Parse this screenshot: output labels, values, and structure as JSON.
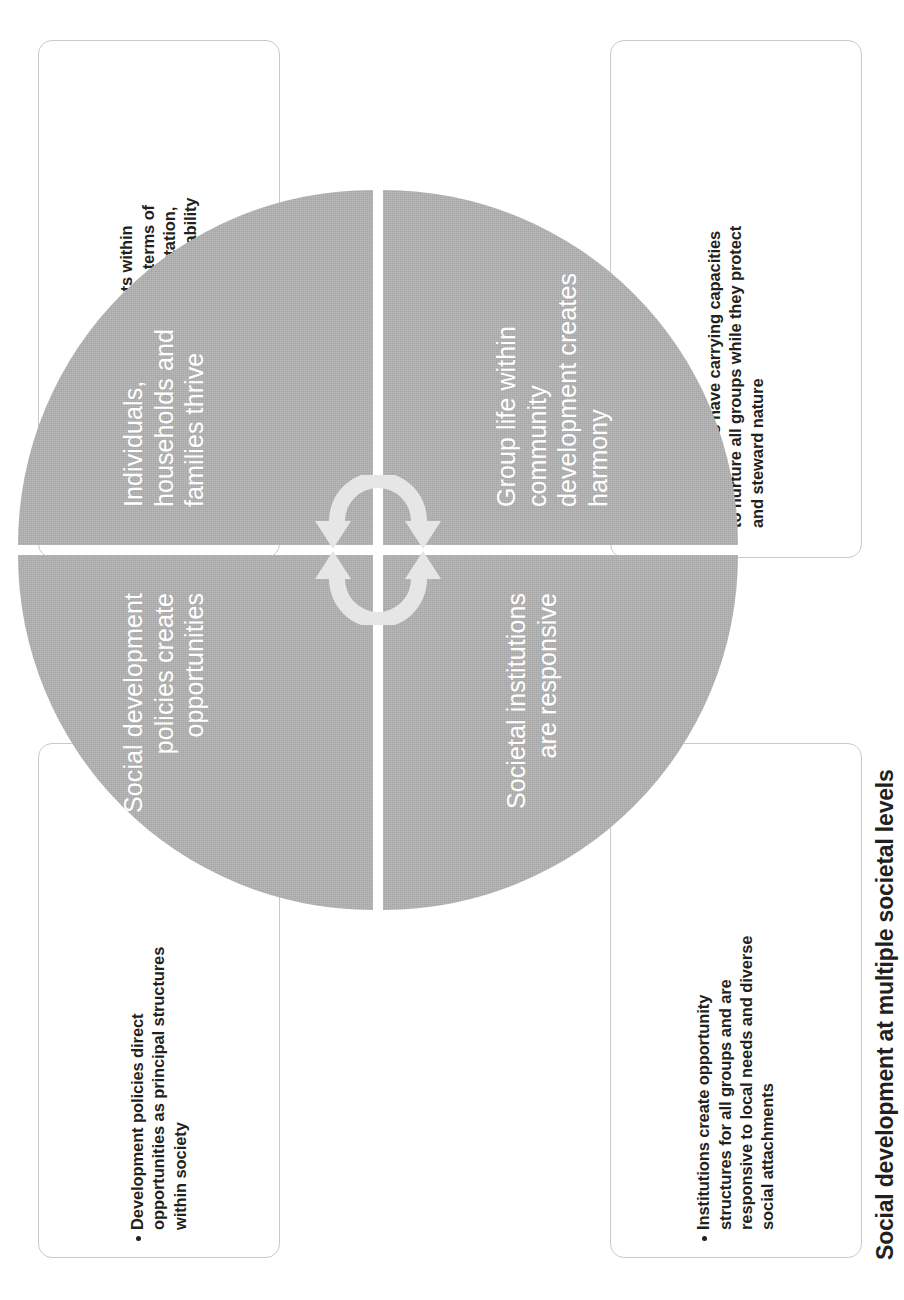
{
  "figure": {
    "caption": "Social development at multiple societal levels",
    "colors": {
      "quadrant_fill": "#b2b2b2",
      "quadrant_text": "#ffffff",
      "callout_border": "#c9c9c9",
      "body_text": "#231f20",
      "arrow": "#e4e4e4"
    }
  },
  "circle": {
    "quadrants": [
      {
        "position": "top-left",
        "label": "Social development policies create opportunities"
      },
      {
        "position": "top-right",
        "label": "Individuals, households and families thrive"
      },
      {
        "position": "bottom-left",
        "label": "Societal institutions are responsive"
      },
      {
        "position": "bottom-right",
        "label": "Group life within community development creates harmony"
      }
    ],
    "center_icon": "cycle-arrows-icon"
  },
  "callouts": [
    {
      "position": "top-left",
      "bullet": "Development policies direct opportunities as principal structures within society"
    },
    {
      "position": "top-right",
      "bullet": "The most intimate environments within community life benefit directly in terms of education, health, housing, tranportation, jobs, income, and ecological sustainability"
    },
    {
      "position": "bottom-left",
      "bullet": "Institutions create opportunity structures for all groups and are responsive to local needs and diverse social attachments"
    },
    {
      "position": "bottom-right",
      "bullet": "Communities have carrying capacities to nurture all groups while they protect and steward nature"
    }
  ]
}
